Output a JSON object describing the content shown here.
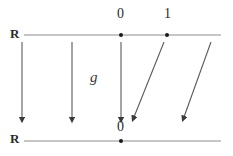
{
  "figure": {
    "background_color": "#ffffff",
    "line_color": "#8a8a8a",
    "arrow_color": "#555555",
    "text_color": "#2b2b2b",
    "width": 233,
    "height": 156
  },
  "top_axis": {
    "label": "R",
    "tick_labels": [
      "0",
      "1"
    ],
    "tick_positions": [
      121,
      167
    ],
    "y": 35,
    "x_start": 24,
    "x_end": 221
  },
  "bottom_axis": {
    "label": "R",
    "tick_labels": [
      "0"
    ],
    "tick_positions": [
      121
    ],
    "y": 141,
    "x_start": 24,
    "x_end": 221
  },
  "map_label": "g",
  "arrows": [
    {
      "name": "vertical-arrow-1",
      "x1": 22,
      "y1": 42,
      "x2": 22,
      "y2": 120,
      "kind": "vertical"
    },
    {
      "name": "vertical-arrow-2",
      "x1": 72,
      "y1": 42,
      "x2": 72,
      "y2": 120,
      "kind": "vertical"
    },
    {
      "name": "vertical-arrow-3",
      "x1": 121,
      "y1": 42,
      "x2": 121,
      "y2": 120,
      "kind": "vertical"
    },
    {
      "name": "slanted-arrow-1",
      "x1": 163,
      "y1": 42,
      "x2": 133,
      "y2": 120,
      "kind": "slanted"
    },
    {
      "name": "slanted-arrow-2",
      "x1": 210,
      "y1": 42,
      "x2": 183,
      "y2": 120,
      "kind": "slanted"
    }
  ]
}
